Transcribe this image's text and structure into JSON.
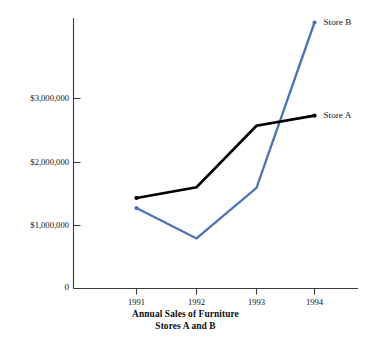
{
  "chart_data": {
    "type": "line",
    "title": "Annual Sales of Furniture",
    "subtitle": "Stores A and B",
    "xlabel": "",
    "ylabel": "",
    "categories": [
      "1991",
      "1992",
      "1993",
      "1994"
    ],
    "x": [
      1991,
      1992,
      1993,
      1994
    ],
    "series": [
      {
        "name": "Store A",
        "color": "#000000",
        "values": [
          1430000,
          1600000,
          2570000,
          2730000
        ]
      },
      {
        "name": "Store B",
        "color": "#4a72b8",
        "values": [
          1270000,
          790000,
          1590000,
          4200000
        ]
      }
    ],
    "ylim": [
      0,
      4450000
    ],
    "ytick_values": [
      0,
      1000000,
      2000000,
      3000000
    ],
    "ytick_labels": [
      "0",
      "$1,000,000",
      "$2,000,000",
      "$3,000,000"
    ],
    "grid": false,
    "legend_position": "inline-right-of-last-point",
    "annotations": [
      {
        "text": "Store B",
        "series": "Store B",
        "at_x": 1994
      },
      {
        "text": "Store A",
        "series": "Store A",
        "at_x": 1994
      }
    ]
  },
  "axes": {
    "y_axis_name": "y-axis",
    "x_axis_name": "x-axis"
  }
}
